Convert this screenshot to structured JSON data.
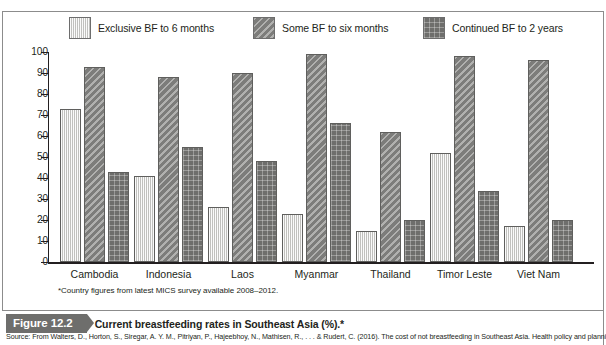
{
  "figure": {
    "tag": "Figure 12.2",
    "caption": "Current breastfeeding rates in Southeast Asia (%).*",
    "footnote": "*Country figures from latest MICS survey available 2008–2012.",
    "source": "Source: From Walters, D., Horton, S., Siregar, A. Y. M., Pitriyan, P., Hajeebhoy, N., Mathisen, R., . . . & Rudert, C. (2016). The cost of not breastfeeding in Southeast Asia. Health policy and planning, 31(8),"
  },
  "colors": {
    "exclusive": "#dededc",
    "some": "#8f8f8d",
    "continued": "#6e6e6c",
    "axis": "#231f20",
    "frame": "#8c8c8c",
    "tag_background": "#6e6e6c",
    "tag_text": "#ffffff"
  },
  "chart_data": {
    "type": "bar",
    "title": "Current breastfeeding rates in Southeast Asia (%).*",
    "xlabel": "",
    "ylabel": "",
    "ylim": [
      0,
      100
    ],
    "yticks": [
      0,
      10,
      20,
      30,
      40,
      50,
      60,
      70,
      80,
      90,
      100
    ],
    "ytick_labels": [
      "0",
      "10",
      "20",
      "30",
      "40",
      "50",
      "60",
      "70",
      "80",
      "90",
      "100"
    ],
    "grid": false,
    "legend_position": "top",
    "categories": [
      "Cambodia",
      "Indonesia",
      "Laos",
      "Myanmar",
      "Thailand",
      "Timor Leste",
      "Viet Nam"
    ],
    "series": [
      {
        "name": "Exclusive BF to 6 months",
        "pattern": "vertical-lines",
        "color": "#dededc",
        "values": [
          73,
          41,
          26,
          23,
          15,
          52,
          17
        ]
      },
      {
        "name": "Some BF to six months",
        "pattern": "diagonal-stripes",
        "color": "#8f8f8d",
        "values": [
          93,
          88,
          90,
          99,
          62,
          98,
          96
        ]
      },
      {
        "name": "Continued BF to 2 years",
        "pattern": "crosshatch-grid",
        "color": "#6e6e6c",
        "values": [
          43,
          55,
          48,
          66,
          20,
          34,
          20
        ]
      }
    ]
  }
}
